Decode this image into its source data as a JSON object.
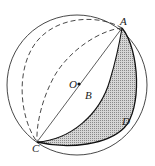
{
  "figure": {
    "labels": {
      "A": "A",
      "B": "B",
      "C": "C",
      "D": "D",
      "O": "O"
    },
    "colors": {
      "stroke": "#222222",
      "shade": "#bdbdbd",
      "background": "#ffffff"
    }
  }
}
